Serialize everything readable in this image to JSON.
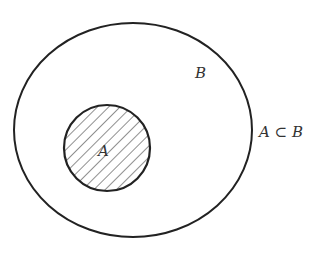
{
  "diagram": {
    "type": "venn-subset",
    "outer_set": {
      "label": "B"
    },
    "inner_set": {
      "label": "A",
      "fill": "hatched"
    },
    "relation": "A ⊂ B",
    "stroke_color": "#222222",
    "hatch_color": "#444444"
  }
}
